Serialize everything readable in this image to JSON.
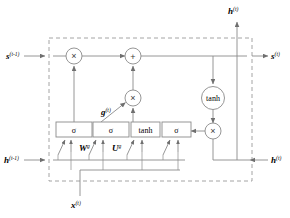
{
  "diagram": {
    "type": "neural-network-cell",
    "colors": {
      "line": "#8a8a8a",
      "dashed_border": "#9a9a9a",
      "text": "#000000",
      "background": "#ffffff"
    },
    "io_labels": {
      "state_in": "s",
      "state_in_sup": "(t-1)",
      "state_out": "s",
      "state_out_sup": "(t)",
      "hidden_in": "h",
      "hidden_in_sup": "(t-1)",
      "hidden_out_right": "h",
      "hidden_out_right_sup": "(t)",
      "hidden_out_top": "h",
      "hidden_out_top_sup": "(t)",
      "input": "x",
      "input_sup": "(t)"
    },
    "annotations": [
      {
        "name": "gate-candidate-label",
        "text": "g",
        "sup": "(t)"
      },
      {
        "name": "weight-w-label",
        "text": "W",
        "sup": "g"
      },
      {
        "name": "weight-u-label",
        "text": "U",
        "sup": "g"
      }
    ],
    "gates": [
      {
        "name": "forget-gate",
        "label": "σ"
      },
      {
        "name": "input-gate",
        "label": "σ"
      },
      {
        "name": "candidate-gate",
        "label": "tanh"
      },
      {
        "name": "output-gate",
        "label": "σ"
      }
    ],
    "operators": [
      {
        "name": "forget-multiply",
        "symbol": "×"
      },
      {
        "name": "state-add",
        "symbol": "+"
      },
      {
        "name": "input-multiply",
        "symbol": "×"
      },
      {
        "name": "output-multiply",
        "symbol": "×"
      }
    ],
    "activation_node": {
      "name": "state-tanh",
      "label": "tanh"
    },
    "caption": ""
  }
}
